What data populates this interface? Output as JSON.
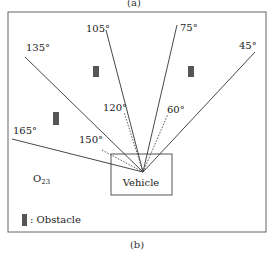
{
  "figure": {
    "top_caption": "(a)",
    "bottom_caption": "(b)"
  },
  "diagram": {
    "origin_label": "Vehicle",
    "region_label": "O",
    "region_subscript": "23",
    "legend_text": ": Obstacle",
    "obstacle_color": "#555555",
    "line_color": "#333333",
    "solid_rays": [
      {
        "angle": "135°"
      },
      {
        "angle": "105°"
      },
      {
        "angle": "75°"
      },
      {
        "angle": "45°"
      },
      {
        "angle": "165°"
      }
    ],
    "dotted_rays": [
      {
        "angle": "120°"
      },
      {
        "angle": "60°"
      },
      {
        "angle": "150°"
      }
    ]
  }
}
